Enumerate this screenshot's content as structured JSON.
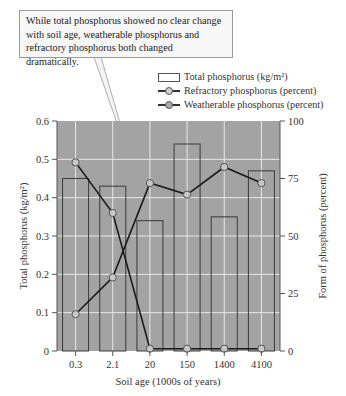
{
  "callout": {
    "lines": [
      "While total phosphorus showed no clear change",
      "with soil age, weatherable phosphorus and",
      "refractory phosphorus both changed dramatically."
    ]
  },
  "legend": {
    "bars": "Total phosphorus (kg/m²)",
    "refractory": "Refractory phosphorus (percent)",
    "weatherable": "Weatherable phosphorus (percent)"
  },
  "colors": {
    "plot_bg": "#a3a3a3",
    "grid": "#e8e8e8",
    "bar_outline": "#3a3a3a",
    "line": "#1a1a1a",
    "marker_fill": "#c8c8c8"
  },
  "chart_data": {
    "type": "bar",
    "title": "",
    "annotation": "While total phosphorus showed no clear change with soil age, weatherable phosphorus and refractory phosphorus both changed dramatically.",
    "xlabel": "Soil age (1000s of years)",
    "ylabel": "Total phosphorus (kg/m²)",
    "y2label": "Form of phosphorus (percent)",
    "categories": [
      "0.3",
      "2.1",
      "20",
      "150",
      "1400",
      "4100"
    ],
    "ylim": [
      0,
      0.6
    ],
    "y2lim": [
      0,
      100
    ],
    "yticks": [
      "0",
      "0.1",
      "0.2",
      "0.3",
      "0.4",
      "0.5",
      "0.6"
    ],
    "y2ticks": [
      "0",
      "25",
      "50",
      "75",
      "100"
    ],
    "grid": true,
    "legend_position": "top-right",
    "series": [
      {
        "name": "Total phosphorus (kg/m²)",
        "type": "bar",
        "axis": "left",
        "values": [
          0.45,
          0.43,
          0.34,
          0.54,
          0.35,
          0.47
        ]
      },
      {
        "name": "Refractory phosphorus (percent)",
        "type": "line",
        "axis": "right",
        "values": [
          16,
          32,
          73,
          68,
          80,
          73
        ]
      },
      {
        "name": "Weatherable phosphorus (percent)",
        "type": "line",
        "axis": "right",
        "values": [
          82,
          60,
          1,
          1,
          1,
          1
        ]
      }
    ]
  }
}
